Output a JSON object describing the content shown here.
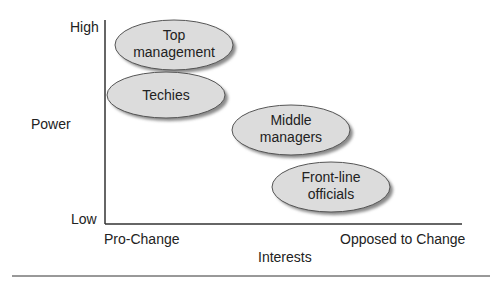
{
  "y_axis": {
    "title": "Power",
    "high_label": "High",
    "low_label": "Low"
  },
  "x_axis": {
    "title": "Interests",
    "left_label": "Pro-Change",
    "right_label": "Opposed to Change"
  },
  "groups": [
    {
      "line1": "Top",
      "line2": "management",
      "power": "high",
      "interest": "pro-change"
    },
    {
      "line1": "Techies",
      "line2": "",
      "power": "high",
      "interest": "pro-change"
    },
    {
      "line1": "Middle",
      "line2": "managers",
      "power": "medium",
      "interest": "neutral"
    },
    {
      "line1": "Front-line",
      "line2": "officials",
      "power": "low",
      "interest": "opposed"
    }
  ],
  "colors": {
    "ellipse_fill": "#dcdcdc",
    "ellipse_stroke": "#555555",
    "shadow": "#8a8a8a",
    "axis": "#333333"
  }
}
